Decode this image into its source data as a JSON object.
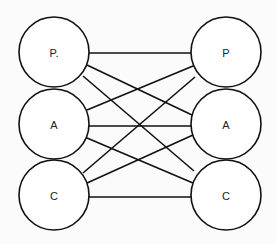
{
  "diagram": {
    "type": "bipartite-graph",
    "background": "#fbfbfb",
    "stroke_color": "#111111",
    "left_nodes": [
      {
        "id": "L-P",
        "label": "P.",
        "cx": 54,
        "cy": 52,
        "r": 35
      },
      {
        "id": "L-A",
        "label": "A",
        "cx": 54,
        "cy": 124,
        "r": 35
      },
      {
        "id": "L-C",
        "label": "C",
        "cx": 54,
        "cy": 195,
        "r": 35
      }
    ],
    "right_nodes": [
      {
        "id": "R-P",
        "label": "P",
        "cx": 226,
        "cy": 52,
        "r": 35
      },
      {
        "id": "R-A",
        "label": "A",
        "cx": 226,
        "cy": 124,
        "r": 35
      },
      {
        "id": "R-C",
        "label": "C",
        "cx": 226,
        "cy": 195,
        "r": 35
      }
    ],
    "edges": [
      {
        "from": "P.",
        "to": "P",
        "x1": 89,
        "y1": 53,
        "x2": 191,
        "y2": 53
      },
      {
        "from": "P.",
        "to": "A",
        "x1": 87,
        "y1": 65,
        "x2": 192,
        "y2": 115
      },
      {
        "from": "P.",
        "to": "C",
        "x1": 83,
        "y1": 76,
        "x2": 194,
        "y2": 171
      },
      {
        "from": "A",
        "to": "P",
        "x1": 87,
        "y1": 110,
        "x2": 193,
        "y2": 66
      },
      {
        "from": "A",
        "to": "A",
        "x1": 89,
        "y1": 126,
        "x2": 191,
        "y2": 126
      },
      {
        "from": "A",
        "to": "C",
        "x1": 87,
        "y1": 138,
        "x2": 193,
        "y2": 183
      },
      {
        "from": "C",
        "to": "P",
        "x1": 83,
        "y1": 173,
        "x2": 195,
        "y2": 77
      },
      {
        "from": "C",
        "to": "A",
        "x1": 87,
        "y1": 183,
        "x2": 193,
        "y2": 135
      },
      {
        "from": "C",
        "to": "C",
        "x1": 89,
        "y1": 197,
        "x2": 191,
        "y2": 197
      }
    ]
  }
}
